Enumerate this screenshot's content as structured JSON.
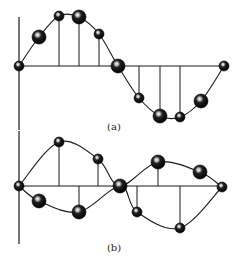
{
  "figure": {
    "panels": [
      {
        "id": "a",
        "label": "(a)",
        "label_pos": [
          114,
          130
        ],
        "axis": {
          "x0": 19,
          "y_top": 17,
          "y_bottom": 130,
          "baseline_y": 66,
          "x_end": 224
        },
        "curves": [
          [
            [
              19,
              66
            ],
            [
              39,
              37
            ],
            [
              59,
              16
            ],
            [
              79,
              17
            ],
            [
              99,
              34
            ],
            [
              118,
              66
            ],
            [
              139,
              98
            ],
            [
              160,
              116
            ],
            [
              180,
              117
            ],
            [
              201,
              101
            ],
            [
              224,
              66
            ]
          ]
        ],
        "balls": [
          {
            "x": 19,
            "y": 66,
            "r": 5
          },
          {
            "x": 39,
            "y": 37,
            "r": 7
          },
          {
            "x": 59,
            "y": 16,
            "r": 5
          },
          {
            "x": 79,
            "y": 17,
            "r": 7
          },
          {
            "x": 99,
            "y": 34,
            "r": 5
          },
          {
            "x": 118,
            "y": 66,
            "r": 7
          },
          {
            "x": 139,
            "y": 98,
            "r": 5
          },
          {
            "x": 160,
            "y": 116,
            "r": 7
          },
          {
            "x": 180,
            "y": 117,
            "r": 5
          },
          {
            "x": 201,
            "y": 101,
            "r": 7
          },
          {
            "x": 224,
            "y": 66,
            "r": 5
          }
        ],
        "stems": [
          {
            "x": 59,
            "y1": 16,
            "y2": 66
          },
          {
            "x": 79,
            "y1": 17,
            "y2": 66
          },
          {
            "x": 99,
            "y1": 34,
            "y2": 66
          },
          {
            "x": 139,
            "y1": 66,
            "y2": 98
          },
          {
            "x": 160,
            "y1": 66,
            "y2": 116
          },
          {
            "x": 180,
            "y1": 66,
            "y2": 117
          }
        ]
      },
      {
        "id": "b",
        "label": "(b)",
        "label_pos": [
          114,
          251
        ],
        "axis": {
          "x0": 19,
          "y_top": 131,
          "y_bottom": 244,
          "baseline_y": 186,
          "x_end": 222
        },
        "curves": [
          [
            [
              19,
              186
            ],
            [
              59,
              142
            ],
            [
              98,
              159
            ],
            [
              120,
              186
            ],
            [
              158,
              162
            ],
            [
              200,
              172
            ],
            [
              222,
              187
            ]
          ],
          [
            [
              19,
              186
            ],
            [
              39,
              201
            ],
            [
              79,
              212
            ],
            [
              120,
              186
            ],
            [
              137,
              212
            ],
            [
              180,
              228
            ],
            [
              222,
              187
            ]
          ]
        ],
        "balls": [
          {
            "x": 19,
            "y": 186,
            "r": 5
          },
          {
            "x": 59,
            "y": 142,
            "r": 5
          },
          {
            "x": 98,
            "y": 159,
            "r": 5
          },
          {
            "x": 120,
            "y": 186,
            "r": 7
          },
          {
            "x": 158,
            "y": 162,
            "r": 7
          },
          {
            "x": 200,
            "y": 172,
            "r": 7
          },
          {
            "x": 222,
            "y": 187,
            "r": 5
          },
          {
            "x": 39,
            "y": 201,
            "r": 7
          },
          {
            "x": 79,
            "y": 212,
            "r": 7
          },
          {
            "x": 137,
            "y": 212,
            "r": 5
          },
          {
            "x": 180,
            "y": 228,
            "r": 5
          }
        ],
        "stems": [
          {
            "x": 59,
            "y1": 142,
            "y2": 186
          },
          {
            "x": 98,
            "y1": 159,
            "y2": 186
          },
          {
            "x": 79,
            "y1": 186,
            "y2": 212
          },
          {
            "x": 158,
            "y1": 162,
            "y2": 186
          },
          {
            "x": 137,
            "y1": 186,
            "y2": 212
          },
          {
            "x": 180,
            "y1": 186,
            "y2": 228
          }
        ]
      }
    ],
    "colors": {
      "line": "#1a1a1a",
      "ball_dark": "#0a0a0a",
      "ball_highlight": "#ffffff",
      "background": "#ffffff"
    }
  }
}
